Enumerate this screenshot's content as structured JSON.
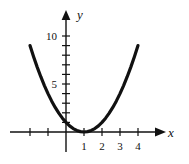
{
  "figure": {
    "background_color": "#ffffff",
    "ink_color": "#111111",
    "width": 189,
    "height": 164
  },
  "axes": {
    "x_axis_label": "x",
    "y_axis_label": "y",
    "x_arrow": "arrow-right",
    "y_arrow": "arrow-up",
    "x_tick_labels": [
      "1",
      "2",
      "3",
      "4"
    ],
    "y_tick_labels": [
      "5",
      "10"
    ]
  },
  "chart_data": {
    "type": "line",
    "title": "",
    "subtitle": "",
    "xlabel": "x",
    "ylabel": "y",
    "grid": false,
    "legend": null,
    "function": "y = (x - 1)^2",
    "vertex": [
      1,
      0
    ],
    "xlim": [
      -2.6,
      4.9
    ],
    "ylim": [
      -1.2,
      11.5
    ],
    "x_ticks": [
      -2,
      -1,
      1,
      2,
      3,
      4
    ],
    "x_tick_labels_shown": {
      "1": "1",
      "2": "2",
      "3": "3",
      "4": "4"
    },
    "y_ticks": [
      1,
      2,
      3,
      4,
      5,
      6,
      7,
      8,
      9,
      10
    ],
    "y_tick_labels_shown": {
      "5": "5",
      "10": "10"
    },
    "series": [
      {
        "name": "y = (x - 1)^2",
        "x": [
          -2.0,
          -1.8,
          -1.6,
          -1.4,
          -1.2,
          -1.0,
          -0.8,
          -0.6,
          -0.4,
          -0.2,
          0.0,
          0.2,
          0.4,
          0.6,
          0.8,
          1.0,
          1.2,
          1.4,
          1.6,
          1.8,
          2.0,
          2.2,
          2.4,
          2.6,
          2.8,
          3.0,
          3.2,
          3.4,
          3.6,
          3.8,
          4.0
        ],
        "y": [
          9.0,
          7.84,
          6.76,
          5.76,
          4.84,
          4.0,
          3.24,
          2.56,
          1.96,
          1.44,
          1.0,
          0.64,
          0.36,
          0.16,
          0.04,
          0.0,
          0.04,
          0.16,
          0.36,
          0.64,
          1.0,
          1.44,
          1.96,
          2.56,
          3.24,
          4.0,
          4.84,
          5.76,
          6.76,
          7.84,
          9.0
        ]
      }
    ]
  }
}
